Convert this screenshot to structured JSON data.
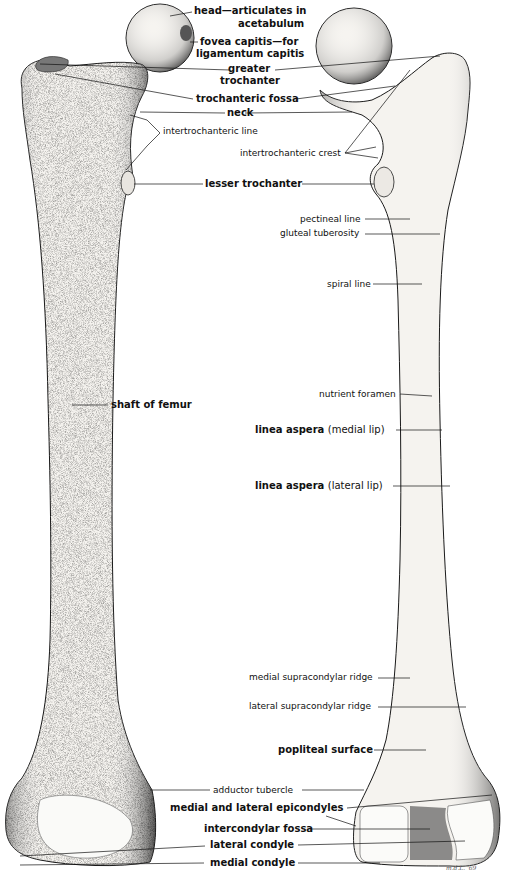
{
  "figure": {
    "left_view": "anterior",
    "right_view": "posterior",
    "signature": "m.d.L. '69"
  },
  "labels": {
    "head": "head",
    "head_desc_1": "—articulates in",
    "head_desc_2": "acetabulum",
    "fovea": "fovea capitis",
    "fovea_desc_1": "—for",
    "fovea_desc_2": "ligamentum capitis",
    "greater_trochanter_1": "greater",
    "greater_trochanter_2": "trochanter",
    "trochanteric_fossa": "trochanteric fossa",
    "neck": "neck",
    "intertrochanteric_line": "intertrochanteric line",
    "intertrochanteric_crest": "intertrochanteric crest",
    "lesser_trochanter": "lesser trochanter",
    "pectineal_line": "pectineal line",
    "gluteal_tuberosity": "gluteal tuberosity",
    "spiral_line": "spiral line",
    "shaft_of_femur": "shaft of femur",
    "nutrient_foramen": "nutrient foramen",
    "linea_aspera": "linea aspera",
    "medial_lip": "(medial lip)",
    "lateral_lip": "(lateral lip)",
    "medial_supracondylar_ridge": "medial supracondylar ridge",
    "lateral_supracondylar_ridge": "lateral supracondylar ridge",
    "popliteal_surface": "popliteal surface",
    "adductor_tubercle": "adductor tubercle",
    "epicondyles": "medial and lateral epicondyles",
    "intercondylar_fossa": "intercondylar fossa",
    "lateral_condyle": "lateral condyle",
    "medial_condyle": "medial condyle"
  },
  "colors": {
    "ink": "#111111",
    "bone_fill": "#f4f2ee",
    "shade": "#8a8a8a",
    "background": "#ffffff"
  }
}
